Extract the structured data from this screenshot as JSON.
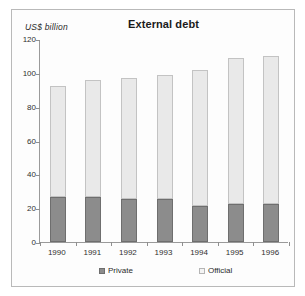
{
  "chart_data": {
    "type": "bar",
    "title": "External debt",
    "subtitle": "",
    "ylabel": "US$  billion",
    "xlabel": "",
    "stacked": true,
    "grid": false,
    "legend_position": "bottom",
    "ylim": [
      0,
      120
    ],
    "yticks": [
      0,
      20,
      40,
      60,
      80,
      100,
      120
    ],
    "ytick_labels": [
      "0",
      "20",
      "40",
      "60",
      "80",
      "100",
      "120"
    ],
    "categories": [
      "1990",
      "1991",
      "1992",
      "1993",
      "1994",
      "1995",
      "1996"
    ],
    "series": [
      {
        "name": "Private",
        "color": "#8c8c8c",
        "values": [
          26.5,
          26.5,
          25.5,
          25.5,
          21.5,
          22.5,
          22.5
        ]
      },
      {
        "name": "Official",
        "color": "#e9e9e9",
        "values": [
          65.5,
          69.5,
          71.5,
          73.5,
          80.0,
          86.5,
          87.5
        ]
      }
    ],
    "totals": [
      92,
      96,
      97,
      99,
      101.5,
      109,
      110
    ]
  },
  "legend": {
    "items": [
      {
        "label": "Private",
        "swatch": "private"
      },
      {
        "label": "Official",
        "swatch": "official"
      }
    ]
  }
}
